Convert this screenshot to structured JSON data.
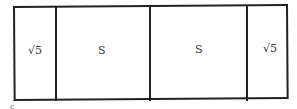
{
  "figure": {
    "type": "rectangle-partition",
    "cells": [
      {
        "label": "√5",
        "x_left": 13,
        "x_right": 56
      },
      {
        "label": "S",
        "x_left": 56,
        "x_right": 150
      },
      {
        "label": "S",
        "x_left": 150,
        "x_right": 247
      },
      {
        "label": "√5",
        "x_left": 247,
        "x_right": 289
      }
    ],
    "vertex_label": "c",
    "stroke_color": "#222222",
    "background_color": "#ffffff"
  }
}
